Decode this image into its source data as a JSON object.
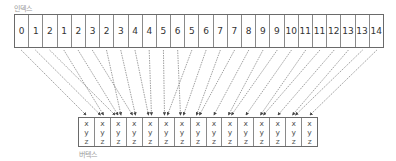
{
  "labels": {
    "index": "인덱스",
    "vertex": "버텍스"
  },
  "indices": [
    0,
    1,
    2,
    1,
    2,
    3,
    2,
    3,
    4,
    4,
    5,
    6,
    5,
    6,
    7,
    7,
    8,
    9,
    9,
    10,
    11,
    11,
    12,
    13,
    13,
    14
  ],
  "vertices": [
    {
      "x": "x",
      "y": "y",
      "z": "z"
    },
    {
      "x": "x",
      "y": "y",
      "z": "z"
    },
    {
      "x": "x",
      "y": "y",
      "z": "z"
    },
    {
      "x": "x",
      "y": "y",
      "z": "z"
    },
    {
      "x": "x",
      "y": "y",
      "z": "z"
    },
    {
      "x": "x",
      "y": "y",
      "z": "z"
    },
    {
      "x": "x",
      "y": "y",
      "z": "z"
    },
    {
      "x": "x",
      "y": "y",
      "z": "z"
    },
    {
      "x": "x",
      "y": "y",
      "z": "z"
    },
    {
      "x": "x",
      "y": "y",
      "z": "z"
    },
    {
      "x": "x",
      "y": "y",
      "z": "z"
    },
    {
      "x": "x",
      "y": "y",
      "z": "z"
    },
    {
      "x": "x",
      "y": "y",
      "z": "z"
    },
    {
      "x": "x",
      "y": "y",
      "z": "z"
    },
    {
      "x": "x",
      "y": "y",
      "z": "z"
    }
  ],
  "colors": {
    "border": "#6a6a6a",
    "arrow": "#777777",
    "label": "#9a9a9a"
  }
}
